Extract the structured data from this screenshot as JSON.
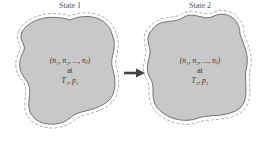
{
  "diagram": {
    "state1": {
      "title": "State 1",
      "composition": "(n₁, n₂, ..., nⱼ)",
      "at": "at",
      "conditions": "T₁, p₁"
    },
    "state2": {
      "title": "State 2",
      "composition": "(n₁, n₂, ..., nⱼ)",
      "at": "at",
      "conditions": "T₂, p₂"
    },
    "arrow": "process-arrow",
    "colors": {
      "fill": "#c8c8c8",
      "outline": "#555555",
      "arrow": "#444444"
    }
  }
}
